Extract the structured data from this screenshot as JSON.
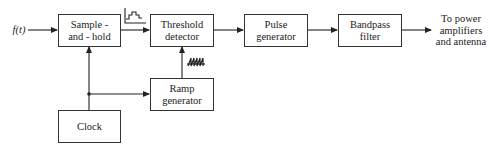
{
  "diagram": {
    "input_label": "f(t)",
    "blocks": [
      {
        "id": "sample_hold",
        "line1": "Sample -",
        "line2": "and - hold"
      },
      {
        "id": "threshold_detector",
        "line1": "Threshold",
        "line2": "detector"
      },
      {
        "id": "pulse_generator",
        "line1": "Pulse",
        "line2": "generator"
      },
      {
        "id": "bandpass_filter",
        "line1": "Bandpass",
        "line2": "filter"
      },
      {
        "id": "ramp_generator",
        "line1": "Ramp",
        "line2": "generator"
      },
      {
        "id": "clock",
        "line1": "Clock",
        "line2": ""
      }
    ],
    "output_label": {
      "line1": "To power",
      "line2": "amplifiers",
      "line3": "and antenna"
    },
    "waveform_icons": [
      {
        "id": "staircase",
        "location": "between sample-and-hold and threshold detector"
      },
      {
        "id": "sawtooth-ramp",
        "location": "between ramp generator and threshold detector"
      }
    ],
    "connections": [
      [
        "f(t)",
        "Sample-and-hold"
      ],
      [
        "Sample-and-hold",
        "Threshold detector"
      ],
      [
        "Threshold detector",
        "Pulse generator"
      ],
      [
        "Pulse generator",
        "Bandpass filter"
      ],
      [
        "Bandpass filter",
        "To power amplifiers and antenna"
      ],
      [
        "Clock",
        "Sample-and-hold"
      ],
      [
        "Clock",
        "Ramp generator"
      ],
      [
        "Ramp generator",
        "Threshold detector"
      ]
    ]
  }
}
